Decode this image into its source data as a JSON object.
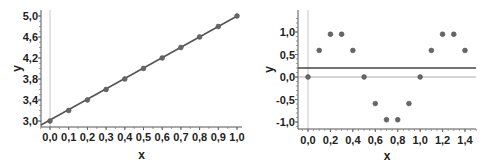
{
  "chart_data": [
    {
      "type": "scatter",
      "title": "",
      "xlabel": "x",
      "ylabel": "y",
      "x": [
        0.0,
        0.1,
        0.2,
        0.3,
        0.4,
        0.5,
        0.6,
        0.7,
        0.8,
        0.9,
        1.0
      ],
      "series": [
        {
          "name": "points",
          "kind": "scatter",
          "values": [
            3.0,
            3.2,
            3.4,
            3.6,
            3.8,
            4.0,
            4.2,
            4.4,
            4.6,
            4.8,
            5.0
          ]
        },
        {
          "name": "fit line",
          "kind": "line",
          "values": [
            3.0,
            5.0
          ],
          "x": [
            0.0,
            1.0
          ]
        }
      ],
      "xticks": [
        "0,0",
        "0,1",
        "0,2",
        "0,3",
        "0,4",
        "0,5",
        "0,6",
        "0,7",
        "0,8",
        "0,9",
        "1,0"
      ],
      "yticks": [
        "3,0",
        "3,4",
        "3,8",
        "4,2",
        "4,6",
        "5,0"
      ],
      "xlim": [
        -0.05,
        1.0
      ],
      "ylim": [
        2.9,
        5.05
      ],
      "grid": false,
      "vertical_reference_line_x": 0.0
    },
    {
      "type": "scatter",
      "title": "",
      "xlabel": "x",
      "ylabel": "y",
      "x": [
        0.0,
        0.1,
        0.2,
        0.3,
        0.4,
        0.5,
        0.6,
        0.7,
        0.8,
        0.9,
        1.0,
        1.1,
        1.2,
        1.3,
        1.4
      ],
      "series": [
        {
          "name": "points",
          "kind": "scatter",
          "values": [
            0.0,
            0.59,
            0.95,
            0.95,
            0.59,
            0.0,
            -0.59,
            -0.95,
            -0.95,
            -0.59,
            0.0,
            0.59,
            0.95,
            0.95,
            0.59
          ]
        },
        {
          "name": "mean line",
          "kind": "hline",
          "values": [
            0.2
          ]
        }
      ],
      "xticks": [
        "0,0",
        "0,2",
        "0,4",
        "0,6",
        "0,8",
        "1,0",
        "1,2",
        "1,4"
      ],
      "yticks": [
        "-1,0",
        "-0,5",
        "0,0",
        "0,5",
        "1,0"
      ],
      "xlim": [
        -0.08,
        1.5
      ],
      "ylim": [
        -1.1,
        1.35
      ],
      "grid": false,
      "zero_reference_line_y": 0.0,
      "vertical_reference_line_x": 0.0
    }
  ]
}
